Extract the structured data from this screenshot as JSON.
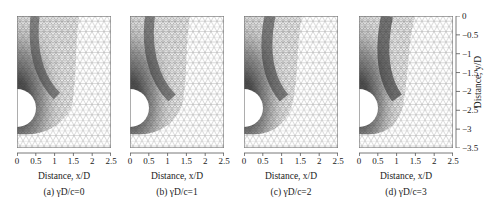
{
  "figure": {
    "panels": [
      {
        "id": "a",
        "caption": "(a) γD/c=0",
        "xlabel": "Distance, x/D"
      },
      {
        "id": "b",
        "caption": "(b) γD/c=1",
        "xlabel": "Distance, x/D"
      },
      {
        "id": "c",
        "caption": "(c) γD/c=2",
        "xlabel": "Distance, x/D"
      },
      {
        "id": "d",
        "caption": "(d) γD/c=3",
        "xlabel": "Distance, x/D"
      }
    ],
    "x_ticks": [
      "0",
      "0.5",
      "1",
      "1.5",
      "2",
      "2.5"
    ],
    "y_ticks": [
      "0",
      "−0.5",
      "−1",
      "−1.5",
      "−2",
      "−2.5",
      "−3",
      "−3.5"
    ],
    "ylabel": "Distance, y/D",
    "colors": {
      "mesh_line": "#9a9a9a",
      "dense_mesh": "#444444",
      "background": "#ffffff",
      "axis": "#555555"
    }
  }
}
